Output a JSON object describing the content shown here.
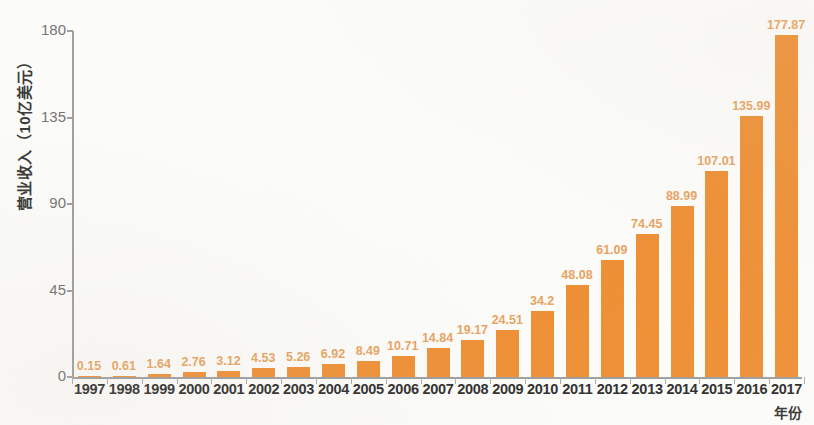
{
  "chart_data": {
    "type": "bar",
    "title": "",
    "xlabel": "年份",
    "ylabel": "营业收入（10亿美元）",
    "categories": [
      "1997",
      "1998",
      "1999",
      "2000",
      "2001",
      "2002",
      "2003",
      "2004",
      "2005",
      "2006",
      "2007",
      "2008",
      "2009",
      "2010",
      "2011",
      "2012",
      "2013",
      "2014",
      "2015",
      "2016",
      "2017"
    ],
    "values": [
      0.15,
      0.61,
      1.64,
      2.76,
      3.12,
      4.53,
      5.26,
      6.92,
      8.49,
      10.71,
      14.84,
      19.17,
      24.51,
      34.2,
      48.08,
      61.09,
      74.45,
      88.99,
      107.01,
      135.99,
      177.87
    ],
    "value_labels": [
      "0.15",
      "0.61",
      "1.64",
      "2.76",
      "3.12",
      "4.53",
      "5.26",
      "6.92",
      "8.49",
      "10.71",
      "14.84",
      "19.17",
      "24.51",
      "34.2",
      "48.08",
      "61.09",
      "74.45",
      "88.99",
      "107.01",
      "135.99",
      "177.87"
    ],
    "ylim": [
      0,
      180
    ],
    "y_ticks": [
      0,
      45,
      90,
      135,
      180
    ],
    "y_tick_labels": [
      "0",
      "45",
      "90",
      "135",
      "180"
    ],
    "grid": false,
    "legend": null,
    "bar_color": "#ee8b2c",
    "value_label_color": "#e8a05a",
    "axis_color": "#9a9a9a",
    "tick_label_color": "#6b6b6b",
    "category_label_color": "#232323",
    "background_color": "#fdfdfb"
  }
}
